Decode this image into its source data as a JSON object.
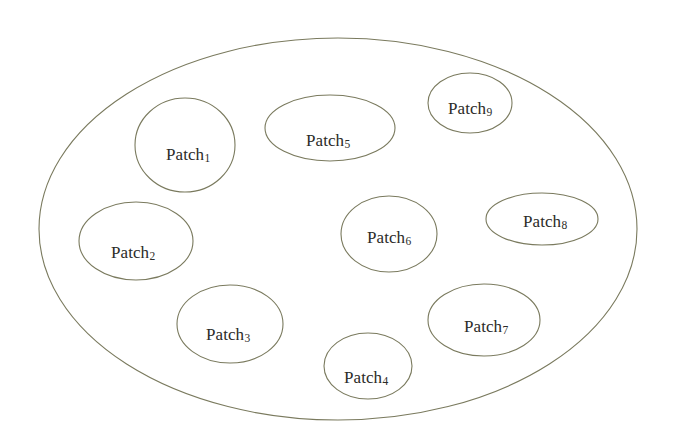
{
  "diagram": {
    "type": "set-containment-diagram",
    "canvas": {
      "width": 678,
      "height": 445
    },
    "colors": {
      "stroke": "#7a7a5e",
      "outer_stroke": "#7a7a5e",
      "text": "#2b2b28",
      "background": "#ffffff"
    },
    "outer_region": {
      "name": "outer-ellipse",
      "label": "",
      "cx": 338,
      "cy": 229,
      "rx": 299,
      "ry": 191
    },
    "patches": [
      {
        "id": "patch-1",
        "label": "Patch",
        "subscript": "1",
        "cx": 185,
        "cy": 145,
        "rx": 50,
        "ry": 47,
        "label_x": 188,
        "label_y": 154
      },
      {
        "id": "patch-2",
        "label": "Patch",
        "subscript": "2",
        "cx": 136,
        "cy": 241,
        "rx": 57,
        "ry": 39,
        "label_x": 133,
        "label_y": 252
      },
      {
        "id": "patch-3",
        "label": "Patch",
        "subscript": "3",
        "cx": 230,
        "cy": 324,
        "rx": 53,
        "ry": 39,
        "label_x": 228,
        "label_y": 334
      },
      {
        "id": "patch-4",
        "label": "Patch",
        "subscript": "4",
        "cx": 368,
        "cy": 366,
        "rx": 44,
        "ry": 33,
        "label_x": 366,
        "label_y": 377
      },
      {
        "id": "patch-5",
        "label": "Patch",
        "subscript": "5",
        "cx": 330,
        "cy": 128,
        "rx": 65,
        "ry": 33,
        "label_x": 328,
        "label_y": 140
      },
      {
        "id": "patch-6",
        "label": "Patch",
        "subscript": "6",
        "cx": 389,
        "cy": 234,
        "rx": 48,
        "ry": 38,
        "label_x": 389,
        "label_y": 237
      },
      {
        "id": "patch-7",
        "label": "Patch",
        "subscript": "7",
        "cx": 484,
        "cy": 320,
        "rx": 56,
        "ry": 36,
        "label_x": 486,
        "label_y": 326
      },
      {
        "id": "patch-8",
        "label": "Patch",
        "subscript": "8",
        "cx": 542,
        "cy": 219,
        "rx": 56,
        "ry": 26,
        "label_x": 545,
        "label_y": 221
      },
      {
        "id": "patch-9",
        "label": "Patch",
        "subscript": "9",
        "cx": 470,
        "cy": 103,
        "rx": 42,
        "ry": 30,
        "label_x": 470,
        "label_y": 108
      }
    ]
  }
}
